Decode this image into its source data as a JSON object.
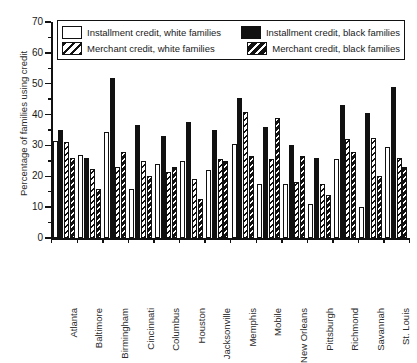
{
  "chart_data": {
    "type": "bar",
    "title": "",
    "xlabel": "",
    "ylabel": "Percentage of families using credit",
    "ylim": [
      0,
      70
    ],
    "yticks": [
      0,
      10,
      20,
      30,
      40,
      50,
      60,
      70
    ],
    "ytick_labels": [
      "0",
      "10",
      "20",
      "30",
      "40",
      "50",
      "60",
      "70"
    ],
    "grid": false,
    "legend_position": "top",
    "categories": [
      "Atlanta",
      "Baltimore",
      "Birmingham",
      "Cincinnati",
      "Columbus",
      "Houston",
      "Jacksonville",
      "Memphis",
      "Mobile",
      "New Orleans",
      "Pittsburgh",
      "Richmond",
      "Savannah",
      "St. Louis"
    ],
    "series": [
      {
        "name": "Installment credit, white families",
        "key": "iw",
        "fill": "white",
        "pattern": "solid",
        "color": "#ffffff",
        "values": [
          31.5,
          27,
          34.5,
          16,
          24,
          25,
          22,
          30.5,
          17.5,
          17.5,
          11,
          25.5,
          10,
          29.5
        ]
      },
      {
        "name": "Installment credit, black families",
        "key": "ib",
        "fill": "black",
        "pattern": "solid",
        "color": "#111111",
        "values": [
          35,
          26,
          52,
          36.5,
          33,
          37.5,
          35,
          45.5,
          36,
          30,
          26,
          43,
          40.5,
          49
        ]
      },
      {
        "name": "Merchant credit, white families",
        "key": "mw",
        "fill": "white",
        "pattern": "diagonal-dark-on-white",
        "color": "#ffffff",
        "values": [
          31,
          22.5,
          23,
          25,
          21.5,
          19,
          25.5,
          41,
          25.5,
          18,
          17.5,
          32,
          32.5,
          26
        ]
      },
      {
        "name": "Merchant credit, black families",
        "key": "mb",
        "fill": "black",
        "pattern": "diagonal-white-on-black",
        "color": "#111111",
        "values": [
          26,
          16,
          28,
          20,
          23,
          12.5,
          25,
          26.5,
          39,
          26.5,
          14,
          28,
          20,
          23
        ]
      }
    ]
  },
  "legend": {
    "entries": [
      {
        "label": "Installment credit, white families",
        "key": "iw"
      },
      {
        "label": "Installment credit, black families",
        "key": "ib"
      },
      {
        "label": "Merchant credit, white families",
        "key": "mw"
      },
      {
        "label": "Merchant credit, black families",
        "key": "mb"
      }
    ]
  },
  "colors": {
    "axis": "#111111",
    "text": "#1a1a1a",
    "background": "#ffffff",
    "dark_fill": "#111111",
    "light_fill": "#ffffff"
  }
}
